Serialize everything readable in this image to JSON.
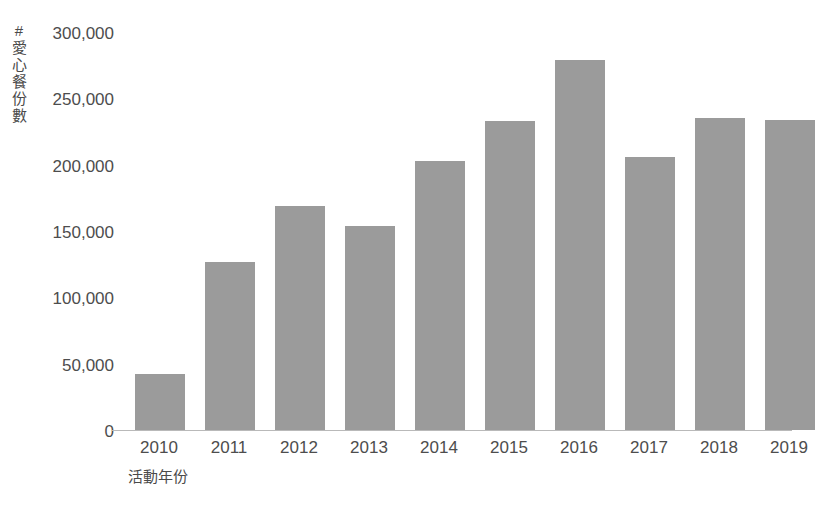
{
  "chart_data": {
    "type": "bar",
    "title": "",
    "subtitle": "",
    "xlabel": "活動年份",
    "ylabel": "# 愛心餐份數",
    "categories": [
      "2010",
      "2011",
      "2012",
      "2013",
      "2014",
      "2015",
      "2016",
      "2017",
      "2018",
      "2019"
    ],
    "values": [
      42000,
      127000,
      169000,
      154000,
      203000,
      233000,
      279000,
      206000,
      235000,
      234000
    ],
    "series": [
      {
        "name": "愛心餐份數",
        "values": [
          42000,
          127000,
          169000,
          154000,
          203000,
          233000,
          279000,
          206000,
          235000,
          234000
        ]
      }
    ],
    "ylim": [
      0,
      300000
    ],
    "yticks": [
      0,
      50000,
      100000,
      150000,
      200000,
      250000,
      300000
    ],
    "ytick_labels": [
      "0",
      "50,000",
      "100,000",
      "150,000",
      "200,000",
      "250,000",
      "300,000"
    ],
    "grid": false,
    "legend": false,
    "legend_position": "none",
    "bar_color": "#9b9b9b",
    "axis_color": "#b9b9b9",
    "text_color": "#4d4d4d",
    "background_color": "#ffffff"
  }
}
